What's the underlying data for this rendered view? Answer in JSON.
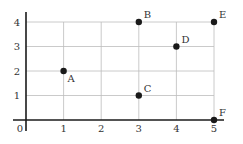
{
  "chart_data": {
    "type": "scatter",
    "title": "",
    "xlabel": "",
    "ylabel": "",
    "xlim": [
      0,
      5
    ],
    "ylim": [
      0,
      4
    ],
    "grid": true,
    "legend": null,
    "x_ticks": [
      "0",
      "1",
      "2",
      "3",
      "4",
      "5"
    ],
    "y_ticks": [
      "1",
      "2",
      "3",
      "4"
    ],
    "points": [
      {
        "label": "A",
        "x": 1,
        "y": 2
      },
      {
        "label": "B",
        "x": 3,
        "y": 4
      },
      {
        "label": "C",
        "x": 3,
        "y": 1
      },
      {
        "label": "D",
        "x": 4,
        "y": 3
      },
      {
        "label": "E",
        "x": 5,
        "y": 4
      },
      {
        "label": "F",
        "x": 5,
        "y": 0
      }
    ]
  },
  "colors": {
    "point": "#1a1a1a",
    "axis": "#1a1a1a",
    "grid": "#bdbdbd",
    "text": "#333333"
  }
}
